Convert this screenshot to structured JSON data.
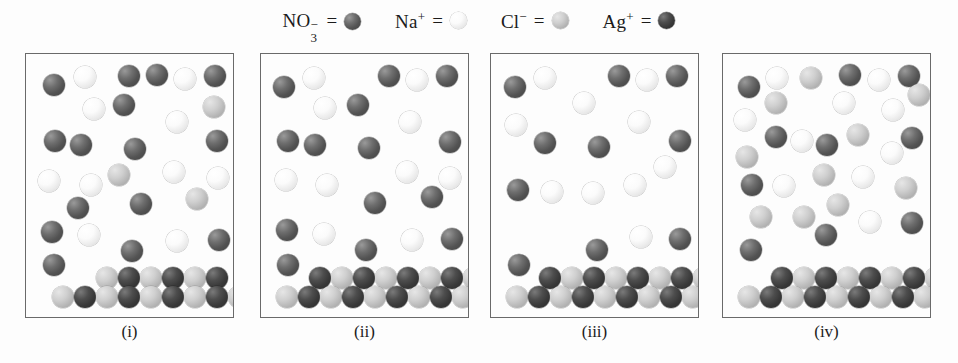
{
  "legend": {
    "items": [
      {
        "name": "nitrate",
        "formula": "NO",
        "sub": "3",
        "charge": "−",
        "equals": "=",
        "species": "no3",
        "color": "#6e6e6e"
      },
      {
        "name": "sodium",
        "formula": "Na",
        "sub": "",
        "charge": "+",
        "equals": "=",
        "species": "na",
        "color": "#fbfbfb"
      },
      {
        "name": "chloride",
        "formula": "Cl",
        "sub": "",
        "charge": "−",
        "equals": "=",
        "species": "cl",
        "color": "#cfcfcf"
      },
      {
        "name": "silver",
        "formula": "Ag",
        "sub": "",
        "charge": "+",
        "equals": "=",
        "species": "ag",
        "color": "#4d4d4d"
      }
    ]
  },
  "diagram": {
    "type": "particulate-representation",
    "species_colors": {
      "no3": "#6e6e6e",
      "na": "#fbfbfb",
      "cl": "#cfcfcf",
      "ag": "#4d4d4d"
    },
    "panel_width": 209,
    "panel_height": 265,
    "panel_tops": 53,
    "panel_lefts": [
      25,
      260,
      490,
      722
    ],
    "sphere_radius_solution": 11,
    "sphere_radius_precipitate": 11,
    "panels": [
      {
        "label": "(i)",
        "counts": {
          "no3": 17,
          "na": 10,
          "cl": 3,
          "ag": 0
        },
        "solution": [
          {
            "s": "no3",
            "x": 17,
            "y": 20
          },
          {
            "s": "na",
            "x": 48,
            "y": 12
          },
          {
            "s": "no3",
            "x": 92,
            "y": 11
          },
          {
            "s": "no3",
            "x": 120,
            "y": 10
          },
          {
            "s": "na",
            "x": 148,
            "y": 14
          },
          {
            "s": "no3",
            "x": 178,
            "y": 11
          },
          {
            "s": "na",
            "x": 57,
            "y": 44
          },
          {
            "s": "no3",
            "x": 87,
            "y": 40
          },
          {
            "s": "cl",
            "x": 177,
            "y": 42
          },
          {
            "s": "na",
            "x": 140,
            "y": 57
          },
          {
            "s": "no3",
            "x": 18,
            "y": 76
          },
          {
            "s": "no3",
            "x": 44,
            "y": 80
          },
          {
            "s": "no3",
            "x": 98,
            "y": 84
          },
          {
            "s": "no3",
            "x": 180,
            "y": 76
          },
          {
            "s": "cl",
            "x": 82,
            "y": 110
          },
          {
            "s": "na",
            "x": 137,
            "y": 107
          },
          {
            "s": "na",
            "x": 12,
            "y": 116
          },
          {
            "s": "na",
            "x": 54,
            "y": 120
          },
          {
            "s": "na",
            "x": 181,
            "y": 113
          },
          {
            "s": "no3",
            "x": 104,
            "y": 139
          },
          {
            "s": "cl",
            "x": 160,
            "y": 134
          },
          {
            "s": "no3",
            "x": 41,
            "y": 143
          },
          {
            "s": "no3",
            "x": 15,
            "y": 167
          },
          {
            "s": "na",
            "x": 52,
            "y": 170
          },
          {
            "s": "na",
            "x": 140,
            "y": 176
          },
          {
            "s": "no3",
            "x": 182,
            "y": 175
          },
          {
            "s": "no3",
            "x": 95,
            "y": 186
          },
          {
            "s": "no3",
            "x": 17,
            "y": 200
          }
        ],
        "precipitate": {
          "rows": [
            {
              "y": 213,
              "start": 70,
              "step": 22,
              "pattern": [
                "cl",
                "ag",
                "cl",
                "ag",
                "cl",
                "ag"
              ]
            },
            {
              "y": 232,
              "start": 26,
              "step": 22,
              "pattern": [
                "cl",
                "ag",
                "cl",
                "ag",
                "cl",
                "ag",
                "cl",
                "ag",
                "cl",
                "ag"
              ]
            }
          ]
        }
      },
      {
        "label": "(ii)",
        "counts": {
          "no3": 13,
          "na": 9,
          "cl": 0,
          "ag": 0
        },
        "solution": [
          {
            "s": "no3",
            "x": 12,
            "y": 22
          },
          {
            "s": "na",
            "x": 42,
            "y": 13
          },
          {
            "s": "no3",
            "x": 117,
            "y": 11
          },
          {
            "s": "na",
            "x": 145,
            "y": 15
          },
          {
            "s": "no3",
            "x": 175,
            "y": 11
          },
          {
            "s": "na",
            "x": 53,
            "y": 43
          },
          {
            "s": "no3",
            "x": 86,
            "y": 40
          },
          {
            "s": "na",
            "x": 138,
            "y": 57
          },
          {
            "s": "no3",
            "x": 16,
            "y": 76
          },
          {
            "s": "no3",
            "x": 43,
            "y": 80
          },
          {
            "s": "no3",
            "x": 97,
            "y": 83
          },
          {
            "s": "no3",
            "x": 178,
            "y": 77
          },
          {
            "s": "na",
            "x": 14,
            "y": 115
          },
          {
            "s": "na",
            "x": 55,
            "y": 120
          },
          {
            "s": "na",
            "x": 135,
            "y": 107
          },
          {
            "s": "na",
            "x": 178,
            "y": 113
          },
          {
            "s": "no3",
            "x": 103,
            "y": 138
          },
          {
            "s": "no3",
            "x": 160,
            "y": 132
          },
          {
            "s": "no3",
            "x": 15,
            "y": 165
          },
          {
            "s": "na",
            "x": 52,
            "y": 169
          },
          {
            "s": "na",
            "x": 140,
            "y": 175
          },
          {
            "s": "no3",
            "x": 180,
            "y": 174
          },
          {
            "s": "no3",
            "x": 94,
            "y": 185
          },
          {
            "s": "no3",
            "x": 16,
            "y": 200
          }
        ],
        "precipitate": {
          "rows": [
            {
              "y": 213,
              "start": 48,
              "step": 22,
              "pattern": [
                "ag",
                "cl",
                "ag",
                "cl",
                "ag",
                "cl",
                "ag",
                "cl"
              ]
            },
            {
              "y": 232,
              "start": 15,
              "step": 22,
              "pattern": [
                "cl",
                "ag",
                "cl",
                "ag",
                "cl",
                "ag",
                "cl",
                "ag",
                "cl"
              ]
            }
          ]
        }
      },
      {
        "label": "(iii)",
        "counts": {
          "no3": 9,
          "na": 9,
          "cl": 0,
          "ag": 0
        },
        "solution": [
          {
            "s": "no3",
            "x": 13,
            "y": 22
          },
          {
            "s": "na",
            "x": 43,
            "y": 13
          },
          {
            "s": "no3",
            "x": 117,
            "y": 11
          },
          {
            "s": "na",
            "x": 145,
            "y": 15
          },
          {
            "s": "no3",
            "x": 175,
            "y": 11
          },
          {
            "s": "na",
            "x": 82,
            "y": 38
          },
          {
            "s": "na",
            "x": 137,
            "y": 57
          },
          {
            "s": "na",
            "x": 14,
            "y": 60
          },
          {
            "s": "no3",
            "x": 43,
            "y": 78
          },
          {
            "s": "no3",
            "x": 97,
            "y": 82
          },
          {
            "s": "no3",
            "x": 178,
            "y": 76
          },
          {
            "s": "na",
            "x": 163,
            "y": 102
          },
          {
            "s": "na",
            "x": 133,
            "y": 120
          },
          {
            "s": "no3",
            "x": 16,
            "y": 125
          },
          {
            "s": "na",
            "x": 50,
            "y": 127
          },
          {
            "s": "na",
            "x": 91,
            "y": 128
          },
          {
            "s": "na",
            "x": 139,
            "y": 172
          },
          {
            "s": "no3",
            "x": 95,
            "y": 185
          },
          {
            "s": "no3",
            "x": 178,
            "y": 174
          },
          {
            "s": "no3",
            "x": 17,
            "y": 200
          }
        ],
        "precipitate": {
          "rows": [
            {
              "y": 213,
              "start": 48,
              "step": 22,
              "pattern": [
                "ag",
                "cl",
                "ag",
                "cl",
                "ag",
                "cl",
                "ag",
                "cl"
              ]
            },
            {
              "y": 232,
              "start": 15,
              "step": 22,
              "pattern": [
                "cl",
                "ag",
                "cl",
                "ag",
                "cl",
                "ag",
                "cl",
                "ag",
                "cl"
              ]
            }
          ]
        }
      },
      {
        "label": "(iv)",
        "counts": {
          "no3": 11,
          "na": 10,
          "cl": 11,
          "ag": 0
        },
        "solution": [
          {
            "s": "no3",
            "x": 15,
            "y": 22
          },
          {
            "s": "na",
            "x": 43,
            "y": 13
          },
          {
            "s": "cl",
            "x": 77,
            "y": 13
          },
          {
            "s": "no3",
            "x": 116,
            "y": 10
          },
          {
            "s": "na",
            "x": 145,
            "y": 15
          },
          {
            "s": "no3",
            "x": 175,
            "y": 11
          },
          {
            "s": "cl",
            "x": 185,
            "y": 30
          },
          {
            "s": "na",
            "x": 11,
            "y": 55
          },
          {
            "s": "cl",
            "x": 42,
            "y": 38
          },
          {
            "s": "na",
            "x": 110,
            "y": 38
          },
          {
            "s": "na",
            "x": 159,
            "y": 45
          },
          {
            "s": "no3",
            "x": 42,
            "y": 72
          },
          {
            "s": "na",
            "x": 68,
            "y": 76
          },
          {
            "s": "no3",
            "x": 93,
            "y": 80
          },
          {
            "s": "cl",
            "x": 124,
            "y": 70
          },
          {
            "s": "no3",
            "x": 178,
            "y": 73
          },
          {
            "s": "cl",
            "x": 13,
            "y": 92
          },
          {
            "s": "na",
            "x": 158,
            "y": 88
          },
          {
            "s": "no3",
            "x": 18,
            "y": 120
          },
          {
            "s": "na",
            "x": 50,
            "y": 121
          },
          {
            "s": "cl",
            "x": 90,
            "y": 110
          },
          {
            "s": "na",
            "x": 129,
            "y": 112
          },
          {
            "s": "cl",
            "x": 172,
            "y": 123
          },
          {
            "s": "cl",
            "x": 104,
            "y": 140
          },
          {
            "s": "cl",
            "x": 27,
            "y": 152
          },
          {
            "s": "cl",
            "x": 70,
            "y": 152
          },
          {
            "s": "na",
            "x": 136,
            "y": 157
          },
          {
            "s": "no3",
            "x": 178,
            "y": 158
          },
          {
            "s": "no3",
            "x": 92,
            "y": 170
          },
          {
            "s": "no3",
            "x": 17,
            "y": 185
          }
        ],
        "precipitate": {
          "rows": [
            {
              "y": 213,
              "start": 48,
              "step": 22,
              "pattern": [
                "ag",
                "cl",
                "ag",
                "cl",
                "ag",
                "cl",
                "ag",
                "cl"
              ]
            },
            {
              "y": 232,
              "start": 15,
              "step": 22,
              "pattern": [
                "cl",
                "ag",
                "cl",
                "ag",
                "cl",
                "ag",
                "cl",
                "ag",
                "cl"
              ]
            }
          ]
        }
      }
    ]
  }
}
